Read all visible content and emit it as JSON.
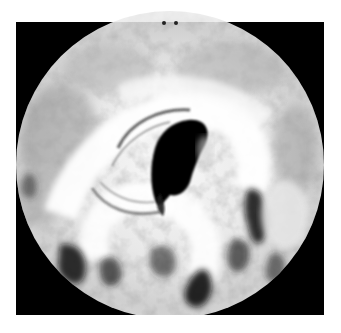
{
  "image": {
    "subject": "Satellite view of a tropical cyclone with a dark central eye and spiral cloud bands",
    "mask_shape": "circle",
    "colors": {
      "page_background": "#ffffff",
      "frame_background": "#000000",
      "cloud_bright": "#f6f6f6",
      "cloud_mid": "#c8c8c8",
      "cloud_dark": "#7a7a7a",
      "eye": "#000000"
    },
    "geometry": {
      "frame": {
        "x": 16,
        "y": 22,
        "width": 308,
        "height": 293
      },
      "circle": {
        "cx": 170,
        "cy": 165,
        "r": 154
      },
      "eye": {
        "cx": 177,
        "cy": 160
      }
    },
    "top_markers": 2
  }
}
